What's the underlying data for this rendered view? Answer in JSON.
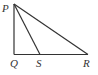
{
  "diagram": {
    "type": "right-triangle",
    "points": {
      "P": {
        "label": "P",
        "x": 14,
        "y": 4
      },
      "Q": {
        "label": "Q",
        "x": 14,
        "y": 54.5
      },
      "S": {
        "label": "S",
        "x": 40,
        "y": 54.5
      },
      "R": {
        "label": "R",
        "x": 88,
        "y": 54.5
      }
    },
    "segments": [
      "PQ",
      "QR",
      "PR",
      "PS"
    ],
    "right_angle_at": "Q",
    "colors": {
      "stroke": "#333333",
      "background": "#ffffff"
    }
  }
}
